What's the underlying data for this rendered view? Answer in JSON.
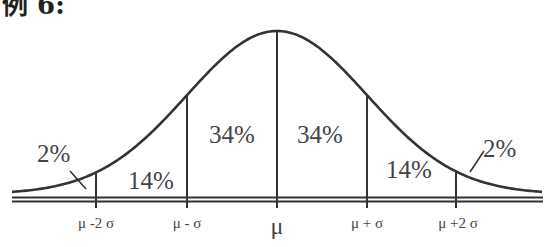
{
  "header": {
    "text": "例 6:"
  },
  "chart_data": {
    "type": "area",
    "curve": "normal (bell) curve",
    "mean_label": "μ",
    "x_ticks": [
      "μ-2σ",
      "μ-σ",
      "μ",
      "μ+σ",
      "μ+2σ"
    ],
    "regions": [
      {
        "range": "< μ-2σ",
        "label": "2%",
        "value": 2
      },
      {
        "range": "μ-2σ to μ-σ",
        "label": "14%",
        "value": 14
      },
      {
        "range": "μ-σ to μ",
        "label": "34%",
        "value": 34
      },
      {
        "range": "μ to μ+σ",
        "label": "34%",
        "value": 34
      },
      {
        "range": "μ+σ to μ+2σ",
        "label": "14%",
        "value": 14
      },
      {
        "range": "> μ+2σ",
        "label": "2%",
        "value": 2
      }
    ]
  },
  "labels": {
    "tick_m2": "μ -2 σ",
    "tick_m1": "μ - σ",
    "tick_0": "μ",
    "tick_p1": "μ + σ",
    "tick_p2": "μ +2 σ",
    "r0": "2%",
    "r1": "14%",
    "r2": "34%",
    "r3": "34%",
    "r4": "14%",
    "r5": "2%"
  },
  "colors": {
    "line": "#333333",
    "text": "#444444"
  }
}
